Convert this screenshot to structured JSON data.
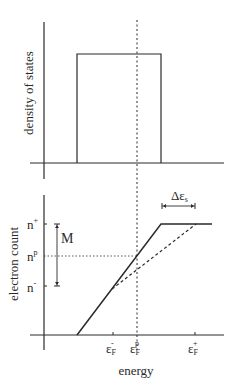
{
  "top_panel": {
    "ylabel": "density of states"
  },
  "bottom_panel": {
    "ylabel": "electron count",
    "xlabel": "energy",
    "y_ticks": [
      {
        "base": "n",
        "sup": "+"
      },
      {
        "base": "n",
        "sup": "p"
      },
      {
        "base": "n",
        "sup": "-"
      }
    ],
    "x_ticks": [
      {
        "base": "ε",
        "sub": "F",
        "sup": "-"
      },
      {
        "base": "ε",
        "sub": "F",
        "sup": "p"
      },
      {
        "base": "ε",
        "sub": "F",
        "sup": "+"
      }
    ],
    "m_label": "M",
    "delta_label": {
      "base": "Δε",
      "sub": "s"
    }
  },
  "colors": {
    "line": "#2a2a2a",
    "background": "#ffffff"
  }
}
